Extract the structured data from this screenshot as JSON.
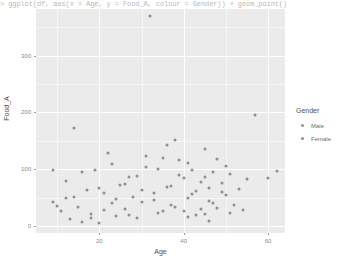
{
  "console": {
    "text": "> ggplot(df, aes(x = Age, y = Food_A, colour = Gender)) + geom_point()"
  },
  "chart_data": {
    "type": "scatter",
    "title": "",
    "xlabel": "Age",
    "ylabel": "Food_A",
    "xlim": [
      5,
      64
    ],
    "ylim": [
      -12,
      382
    ],
    "xticks": [
      20,
      40,
      60
    ],
    "yticks": [
      0,
      100,
      200,
      300
    ],
    "grid": true,
    "legend": {
      "title": "Gender",
      "position": "right",
      "entries": [
        {
          "label": "Male",
          "color": "#8f8f8f"
        },
        {
          "label": "Female",
          "color": "#8f8f8f"
        }
      ]
    },
    "point_color": "#8f8f8f",
    "panel_color": "#ebebeb",
    "series": [
      {
        "name": "Male",
        "points": [
          [
            9,
            98
          ],
          [
            9,
            43
          ],
          [
            11,
            27
          ],
          [
            12,
            49
          ],
          [
            13,
            12
          ],
          [
            14,
            172
          ],
          [
            15,
            33
          ],
          [
            16,
            8
          ],
          [
            17,
            64
          ],
          [
            18,
            22
          ],
          [
            19,
            98
          ],
          [
            20,
            5
          ],
          [
            21,
            58
          ],
          [
            22,
            128
          ],
          [
            23,
            40
          ],
          [
            24,
            18
          ],
          [
            25,
            72
          ],
          [
            26,
            30
          ],
          [
            27,
            86
          ],
          [
            28,
            52
          ],
          [
            29,
            15
          ],
          [
            30,
            63
          ],
          [
            31,
            104
          ],
          [
            32,
            370
          ],
          [
            33,
            46
          ],
          [
            34,
            24
          ],
          [
            35,
            120
          ],
          [
            36,
            69
          ],
          [
            37,
            38
          ],
          [
            38,
            152
          ],
          [
            39,
            90
          ],
          [
            40,
            27
          ],
          [
            41,
            112
          ],
          [
            42,
            56
          ],
          [
            43,
            20
          ],
          [
            44,
            78
          ],
          [
            45,
            136
          ],
          [
            46,
            44
          ],
          [
            47,
            95
          ],
          [
            48,
            32
          ],
          [
            49,
            60
          ],
          [
            50,
            106
          ],
          [
            51,
            23
          ]
        ]
      },
      {
        "name": "Female",
        "points": [
          [
            10,
            35
          ],
          [
            12,
            80
          ],
          [
            14,
            51
          ],
          [
            16,
            96
          ],
          [
            18,
            14
          ],
          [
            20,
            67
          ],
          [
            21,
            29
          ],
          [
            23,
            110
          ],
          [
            24,
            47
          ],
          [
            26,
            75
          ],
          [
            27,
            19
          ],
          [
            29,
            88
          ],
          [
            30,
            42
          ],
          [
            31,
            124
          ],
          [
            33,
            58
          ],
          [
            34,
            100
          ],
          [
            35,
            26
          ],
          [
            36,
            143
          ],
          [
            37,
            71
          ],
          [
            38,
            34
          ],
          [
            39,
            116
          ],
          [
            40,
            84
          ],
          [
            41,
            50
          ],
          [
            42,
            99
          ],
          [
            43,
            62
          ],
          [
            44,
            31
          ],
          [
            45,
            87
          ],
          [
            46,
            68
          ],
          [
            47,
            41
          ],
          [
            48,
            119
          ],
          [
            49,
            76
          ],
          [
            50,
            54
          ],
          [
            51,
            92
          ],
          [
            52,
            37
          ],
          [
            53,
            65
          ],
          [
            54,
            28
          ],
          [
            55,
            83
          ],
          [
            57,
            196
          ],
          [
            60,
            85
          ],
          [
            62,
            97
          ],
          [
            45,
            21
          ],
          [
            46,
            9
          ],
          [
            41,
            16
          ]
        ]
      }
    ]
  }
}
